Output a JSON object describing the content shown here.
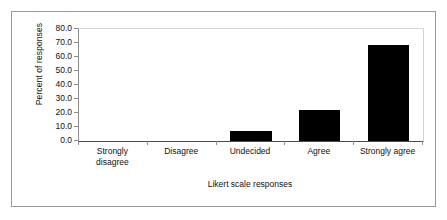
{
  "chart_data": {
    "type": "bar",
    "title": "",
    "xlabel": "Likert scale responses",
    "ylabel": "Percent of responses",
    "categories": [
      "Strongly disagree",
      "Disagree",
      "Undecided",
      "Agree",
      "Strongly agree"
    ],
    "category_lines": [
      [
        "Strongly",
        "disagree"
      ],
      [
        "Disagree"
      ],
      [
        "Undecided"
      ],
      [
        "Agree"
      ],
      [
        "Strongly agree"
      ]
    ],
    "values": [
      0.0,
      0.0,
      7.0,
      22.5,
      68.5
    ],
    "ylim": [
      0.0,
      80.0
    ],
    "ytick_step": 10.0,
    "ytick_labels": [
      "80.0",
      "70.0",
      "60.0",
      "50.0",
      "40.0",
      "30.0",
      "20.0",
      "10.0",
      "0.0"
    ],
    "ytick_values": [
      80.0,
      70.0,
      60.0,
      50.0,
      40.0,
      30.0,
      20.0,
      10.0,
      0.0
    ],
    "grid": false,
    "legend": false,
    "bar_color": "#000000",
    "axis_color": "#4a4a4a",
    "frame_color": "#9a9a9a"
  }
}
